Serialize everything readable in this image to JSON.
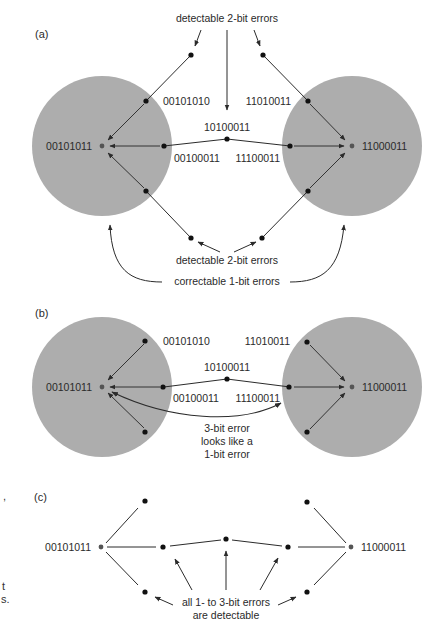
{
  "diagram": {
    "colors": {
      "sphere": "#adadad",
      "line": "#2b2b2b",
      "dot": "#111111",
      "center_dot": "#555555"
    },
    "panel_a": {
      "label": "(a)",
      "codeword_left": "00101011",
      "codeword_right": "11000011",
      "neighbor_left_top": "00101010",
      "neighbor_left_mid": "00100011",
      "middle": "10100011",
      "neighbor_right_mid": "11100011",
      "neighbor_right_top": "11010011",
      "annotation_top": "detectable 2-bit errors",
      "annotation_bottom": "detectable 2-bit errors",
      "annotation_correctable": "correctable 1-bit errors"
    },
    "panel_b": {
      "label": "(b)",
      "codeword_left": "00101011",
      "codeword_right": "11000011",
      "neighbor_left_top": "00101010",
      "neighbor_left_mid": "00100011",
      "middle": "10100011",
      "neighbor_right_mid": "11100011",
      "neighbor_right_top": "11010011",
      "annotation_line1": "3-bit error",
      "annotation_line2": "looks like a",
      "annotation_line3": "1-bit error"
    },
    "panel_c": {
      "label": "(c)",
      "codeword_left": "00101011",
      "codeword_right": "11000011",
      "annotation_line1": "all 1- to 3-bit errors",
      "annotation_line2": "are detectable"
    },
    "margin_fragments": [
      ",",
      "t",
      "s."
    ]
  }
}
